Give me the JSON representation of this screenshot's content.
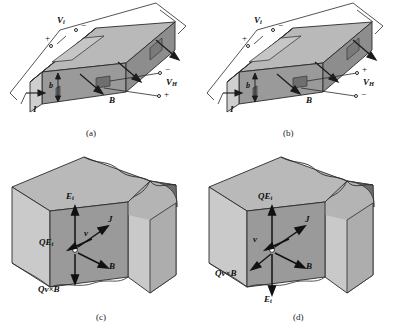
{
  "figure": {
    "type": "hall-effect-diagram",
    "panels": [
      {
        "id": "a",
        "caption": "(a)",
        "description": "Hall effect bar with current I, magnetic field B, input voltage Vi and Hall voltage VH for positive carriers",
        "labels": {
          "vi": "V",
          "vi_sub": "i",
          "vh": "V",
          "vh_sub": "H",
          "current": "I",
          "field": "B",
          "thickness": "b",
          "vi_top_sign": "−",
          "vi_bottom_sign": "+",
          "vh_top_sign": "−",
          "vh_bottom_sign": "+"
        }
      },
      {
        "id": "b",
        "caption": "(b)",
        "description": "Hall effect bar with reversed Hall voltage polarity for negative carriers",
        "labels": {
          "vi": "V",
          "vi_sub": "i",
          "vh": "V",
          "vh_sub": "H",
          "current": "I",
          "field": "B",
          "thickness": "b",
          "vi_top_sign": "−",
          "vi_bottom_sign": "+",
          "vh_top_sign": "+",
          "vh_bottom_sign": "−"
        }
      },
      {
        "id": "c",
        "caption": "(c)",
        "description": "Cutaway detail showing force balance on a positive carrier",
        "labels": {
          "et": "E",
          "et_sub": "t",
          "qet": "QE",
          "qet_sub": "t",
          "velocity": "v",
          "current_density": "J",
          "field": "B",
          "lorentz": "Qv×B"
        }
      },
      {
        "id": "d",
        "caption": "(d)",
        "description": "Cutaway detail showing force balance with reversed transverse field",
        "labels": {
          "et": "E",
          "et_sub": "t",
          "qet": "QE",
          "qet_sub": "t",
          "velocity": "v",
          "current_density": "J",
          "field": "B",
          "lorentz": "Qv×B"
        }
      }
    ],
    "colors": {
      "top_face": "#b9b9b9",
      "front_face": "#9a9a9a",
      "side_face": "#cfcfcf",
      "dark_face": "#7d7d7d",
      "outline": "#2a2a2a",
      "background": "#ffffff"
    }
  }
}
